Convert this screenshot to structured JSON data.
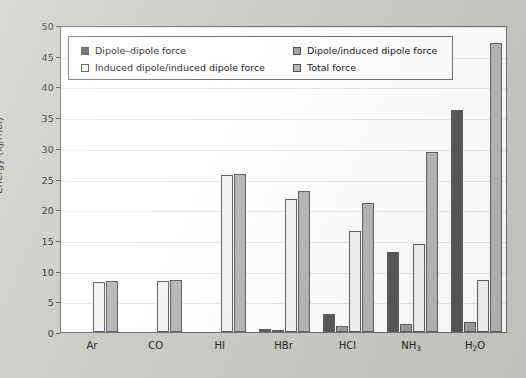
{
  "chart_data": {
    "type": "bar",
    "title": "",
    "xlabel": "",
    "ylabel": "Energy (kJ/mol)",
    "ylim": [
      0,
      50
    ],
    "yticks": [
      0,
      5,
      10,
      15,
      20,
      25,
      30,
      35,
      40,
      45,
      50
    ],
    "grid": true,
    "legend_position": "upper-left-inside",
    "categories": [
      "Ar",
      "CO",
      "HI",
      "HBr",
      "HCl",
      "NH3",
      "H2O"
    ],
    "category_labels_html": [
      "Ar",
      "CO",
      "HI",
      "HBr",
      "HCl",
      "NH<sub>3</sub>",
      "H<sub>2</sub>O"
    ],
    "series": [
      {
        "name": "Dipole–dipole force",
        "color": "#545454",
        "values": [
          0,
          0,
          0,
          0.5,
          3.0,
          13.0,
          36.2
        ]
      },
      {
        "name": "Dipole/induced dipole force",
        "color": "#9e9e9e",
        "values": [
          0,
          0,
          0,
          0.3,
          1.0,
          1.3,
          1.6
        ]
      },
      {
        "name": "Induced dipole/induced dipole force",
        "color": "#f2f2f2",
        "values": [
          8.2,
          8.3,
          25.5,
          21.7,
          16.5,
          14.4,
          8.4
        ]
      },
      {
        "name": "Total force",
        "color": "#b5b5b5",
        "values": [
          8.3,
          8.4,
          25.7,
          22.9,
          21.0,
          29.3,
          47.0
        ]
      }
    ]
  },
  "legend": {
    "entries": [
      {
        "label": "Dipole–dipole force",
        "color": "#545454"
      },
      {
        "label": "Dipole/induced dipole force",
        "color": "#9e9e9e"
      },
      {
        "label": "Induced dipole/induced dipole force",
        "color": "#ffffff"
      },
      {
        "label": "Total force",
        "color": "#b5b5b5"
      }
    ]
  },
  "colors": {
    "page_background": "#c9c9c4",
    "plot_background": "#ffffff",
    "axis": "#6d6d6d",
    "gridline": "#e8e8e8",
    "text": "#1b1b1b"
  }
}
